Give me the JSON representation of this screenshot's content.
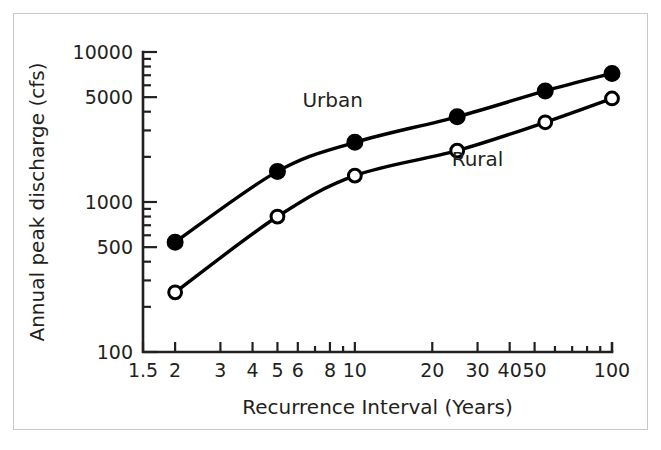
{
  "chart_data": {
    "type": "line",
    "title": "",
    "subtitle": "",
    "xlabel": "Recurrence Interval (Years)",
    "ylabel": "Annual peak discharge (cfs)",
    "xscale": "log",
    "yscale": "log",
    "xlim": [
      1.5,
      100
    ],
    "ylim": [
      100,
      10000
    ],
    "grid": false,
    "legend_position": "inline-annotation",
    "x_tick_labels": [
      "1.5",
      "2",
      "3",
      "4",
      "5",
      "6",
      "8",
      "10",
      "20",
      "30",
      "40",
      "50",
      "100"
    ],
    "x_tick_values": [
      1.5,
      2,
      3,
      4,
      5,
      6,
      8,
      10,
      20,
      30,
      40,
      50,
      100
    ],
    "y_tick_labels": [
      "100",
      "500",
      "1000",
      "5000",
      "10000"
    ],
    "y_tick_values": [
      100,
      500,
      1000,
      5000,
      10000
    ],
    "series": [
      {
        "name": "Urban",
        "marker": "filled-circle",
        "color": "#000000",
        "x": [
          2,
          5,
          10,
          25,
          55,
          100
        ],
        "values": [
          540,
          1600,
          2500,
          3700,
          5500,
          7200
        ]
      },
      {
        "name": "Rural",
        "marker": "open-circle",
        "color": "#000000",
        "x": [
          2,
          5,
          10,
          25,
          55,
          100
        ],
        "values": [
          250,
          800,
          1500,
          2200,
          3400,
          4900
        ]
      }
    ],
    "annotations": [
      {
        "text": "Urban",
        "x": 8.2,
        "y": 4300
      },
      {
        "text": "Rural",
        "x": 30,
        "y": 1750
      }
    ]
  },
  "figure": {
    "frame_color": "#c9c9cb",
    "background": "#ffffff",
    "ink_color": "#231f20"
  }
}
